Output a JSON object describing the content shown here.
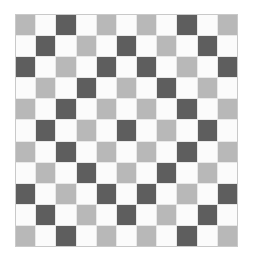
{
  "figure": {
    "name": "checkerboard-pattern",
    "rows": 11,
    "columns": 11,
    "background_color": "#ffffff",
    "border_color": "#c9c9c9",
    "gridline_color": "#e8e8e8"
  },
  "palette": {
    "W": "#fbfbfb",
    "G": "#b8b8b8",
    "D": "#5e5e5e"
  },
  "palette_names": {
    "W": "white",
    "G": "light-gray",
    "D": "dark-gray"
  },
  "chart_data": {
    "type": "heatmap",
    "xlabel": "",
    "ylabel": "",
    "categories": [
      "c1",
      "c2",
      "c3",
      "c4",
      "c5",
      "c6",
      "c7",
      "c8",
      "c9",
      "c10",
      "c11"
    ],
    "row_labels": [
      "r1",
      "r2",
      "r3",
      "r4",
      "r5",
      "r6",
      "r7",
      "r8",
      "r9",
      "r10",
      "r11"
    ],
    "legend": [],
    "grid": [
      [
        "G",
        "W",
        "D",
        "W",
        "G",
        "W",
        "G",
        "W",
        "D",
        "W",
        "G"
      ],
      [
        "W",
        "D",
        "W",
        "G",
        "W",
        "D",
        "W",
        "G",
        "W",
        "D",
        "W"
      ],
      [
        "D",
        "W",
        "G",
        "W",
        "D",
        "W",
        "D",
        "W",
        "G",
        "W",
        "D"
      ],
      [
        "W",
        "G",
        "W",
        "D",
        "W",
        "G",
        "W",
        "D",
        "W",
        "G",
        "W"
      ],
      [
        "G",
        "W",
        "D",
        "W",
        "G",
        "W",
        "G",
        "W",
        "D",
        "W",
        "G"
      ],
      [
        "W",
        "D",
        "W",
        "G",
        "W",
        "D",
        "W",
        "G",
        "W",
        "D",
        "W"
      ],
      [
        "G",
        "W",
        "D",
        "W",
        "G",
        "W",
        "G",
        "W",
        "D",
        "W",
        "G"
      ],
      [
        "W",
        "G",
        "W",
        "D",
        "W",
        "G",
        "W",
        "D",
        "W",
        "G",
        "W"
      ],
      [
        "D",
        "W",
        "G",
        "W",
        "D",
        "W",
        "D",
        "W",
        "G",
        "W",
        "D"
      ],
      [
        "W",
        "D",
        "W",
        "G",
        "W",
        "D",
        "W",
        "G",
        "W",
        "D",
        "W"
      ],
      [
        "G",
        "W",
        "D",
        "W",
        "G",
        "W",
        "G",
        "W",
        "D",
        "W",
        "G"
      ]
    ]
  }
}
